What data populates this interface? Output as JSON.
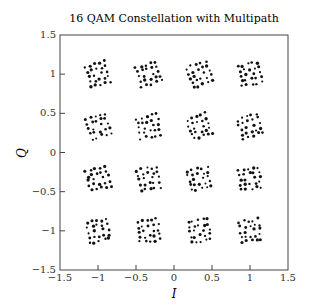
{
  "chart_data": {
    "type": "scatter",
    "title": "16 QAM Constellation with Multipath",
    "xlabel": "I",
    "ylabel": "Q",
    "xlim": [
      -1.5,
      1.5
    ],
    "ylim": [
      -1.5,
      1.5
    ],
    "xticks": [
      "−1.5",
      "−1",
      "−0.5",
      "0",
      "0.5",
      "1",
      "1.5"
    ],
    "xtick_values": [
      -1.5,
      -1,
      -0.5,
      0,
      0.5,
      1,
      1.5
    ],
    "yticks": [
      "−1.5",
      "−1",
      "−0.5",
      "0",
      "0.5",
      "1",
      "1.5"
    ],
    "ytick_values": [
      -1.5,
      -1,
      -0.5,
      0,
      0.5,
      1,
      1.5
    ],
    "grid": false,
    "legend": null,
    "marker_color": "#111111",
    "constellation_levels": [
      -1,
      -0.3333,
      0.3333,
      1
    ],
    "cluster_description": "Each of the 16 ideal points is surrounded by a small rotated square cloud of received symbols (multipath ISI), roughly ±0.12 in spread with an outer ring and inner ring of dots",
    "cluster_centers": [
      [
        -1,
        1
      ],
      [
        -0.3333,
        1
      ],
      [
        0.3333,
        1
      ],
      [
        1,
        1
      ],
      [
        -1,
        0.3333
      ],
      [
        -0.3333,
        0.3333
      ],
      [
        0.3333,
        0.3333
      ],
      [
        1,
        0.3333
      ],
      [
        -1,
        -0.3333
      ],
      [
        -0.3333,
        -0.3333
      ],
      [
        0.3333,
        -0.3333
      ],
      [
        1,
        -0.3333
      ],
      [
        -1,
        -1
      ],
      [
        -0.3333,
        -1
      ],
      [
        0.3333,
        -1
      ],
      [
        1,
        -1
      ]
    ],
    "cluster_half_width": 0.13,
    "cluster_rotation_deg": 15
  }
}
